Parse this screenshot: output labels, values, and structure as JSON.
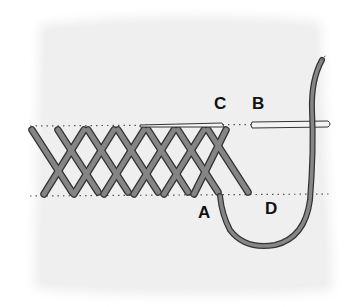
{
  "diagram": {
    "labels": {
      "a": "A",
      "b": "B",
      "c": "C",
      "d": "D"
    },
    "colors": {
      "fabric": "#ececec",
      "thread": "#7d7d7d",
      "thread_outline": "#3a3a3a",
      "needle": "#f2f2f2",
      "guide_dots": "#555555"
    }
  }
}
